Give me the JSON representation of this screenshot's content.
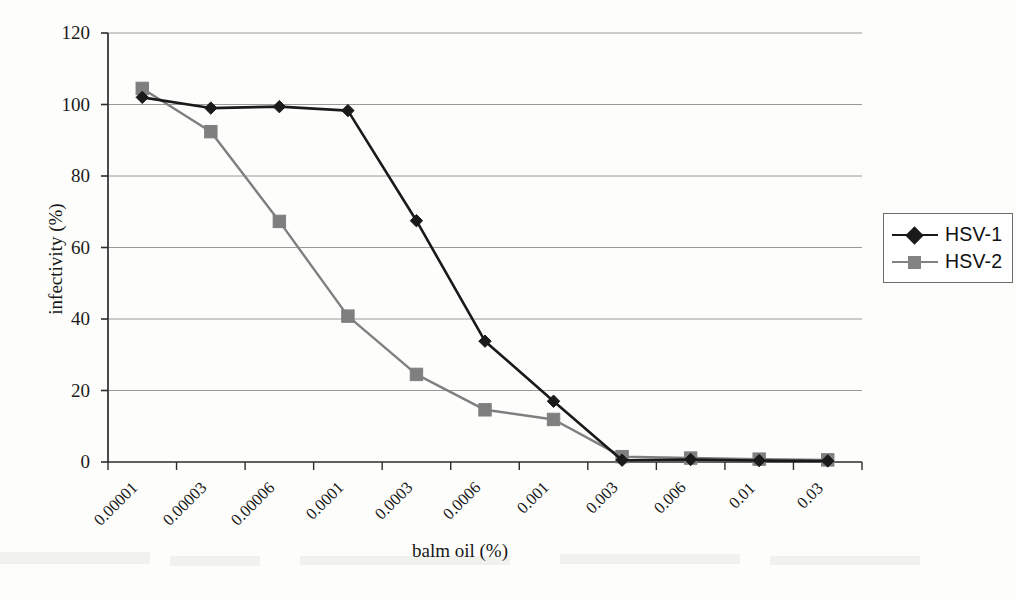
{
  "chart_data": {
    "type": "line",
    "title": "",
    "xlabel": "balm oil (%)",
    "ylabel": "infectivity (%)",
    "categories": [
      "0.00001",
      "0.00003",
      "0.00006",
      "0.0001",
      "0.0003",
      "0.0006",
      "0.001",
      "0.003",
      "0.006",
      "0.01",
      "0.03"
    ],
    "ylim": [
      0,
      120
    ],
    "yticks": [
      0,
      20,
      40,
      60,
      80,
      100,
      120
    ],
    "ytick_labels": [
      "0",
      "20",
      "40",
      "60",
      "80",
      "100",
      "120"
    ],
    "grid": "horizontal",
    "legend_position": "right",
    "series": [
      {
        "name": "HSV-1",
        "color": "#1a1a1a",
        "marker": "diamond",
        "values": [
          102.0,
          99.0,
          99.4,
          98.3,
          67.5,
          33.8,
          17.0,
          0.5,
          0.7,
          0.4,
          0.3
        ]
      },
      {
        "name": "HSV-2",
        "color": "#7f7f7f",
        "marker": "square",
        "values": [
          104.5,
          92.4,
          67.3,
          40.8,
          24.5,
          14.6,
          11.9,
          1.5,
          1.1,
          0.8,
          0.6
        ]
      }
    ]
  },
  "axes": {
    "y_title": "infectivity (%)",
    "x_title": "balm oil (%)"
  },
  "legend": {
    "entries": [
      {
        "label": "HSV-1"
      },
      {
        "label": "HSV-2"
      }
    ]
  }
}
